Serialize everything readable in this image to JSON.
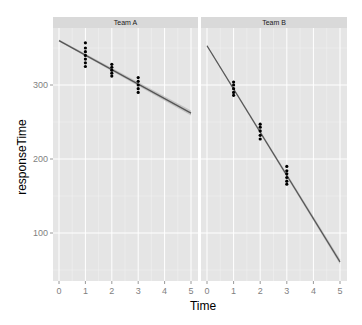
{
  "chart_data": {
    "type": "scatter",
    "title": "",
    "xlabel": "Time",
    "ylabel": "responseTime",
    "facets": [
      "Team A",
      "Team B"
    ],
    "xlim": [
      0,
      5
    ],
    "ylim": [
      40,
      370
    ],
    "x_ticks": [
      0,
      1,
      2,
      3,
      4,
      5
    ],
    "y_ticks": [
      100,
      200,
      300
    ],
    "grid": true,
    "legend": "none",
    "series": [
      {
        "name": "Team A",
        "points": [
          {
            "x": 1,
            "y": [
              325,
              330,
              335,
              340,
              345,
              350,
              357
            ]
          },
          {
            "x": 2,
            "y": [
              312,
              316,
              320,
              324,
              328
            ]
          },
          {
            "x": 3,
            "y": [
              290,
              295,
              300,
              305,
              310
            ]
          }
        ],
        "fit_line": {
          "x": [
            0,
            5
          ],
          "y": [
            360,
            262
          ]
        }
      },
      {
        "name": "Team B",
        "points": [
          {
            "x": 1,
            "y": [
              286,
              290,
              295,
              300,
              304
            ]
          },
          {
            "x": 2,
            "y": [
              227,
              232,
              238,
              243,
              247
            ]
          },
          {
            "x": 3,
            "y": [
              166,
              170,
              175,
              180,
              184,
              190
            ]
          }
        ],
        "fit_line": {
          "x": [
            0,
            5
          ],
          "y": [
            353,
            61
          ]
        }
      }
    ]
  },
  "colors": {
    "panel_bg": "#e5e5e5",
    "strip_bg": "#d9d9d9",
    "grid": "#ffffff",
    "points": "#000000",
    "line": "#555555",
    "ribbon": "#999999"
  }
}
